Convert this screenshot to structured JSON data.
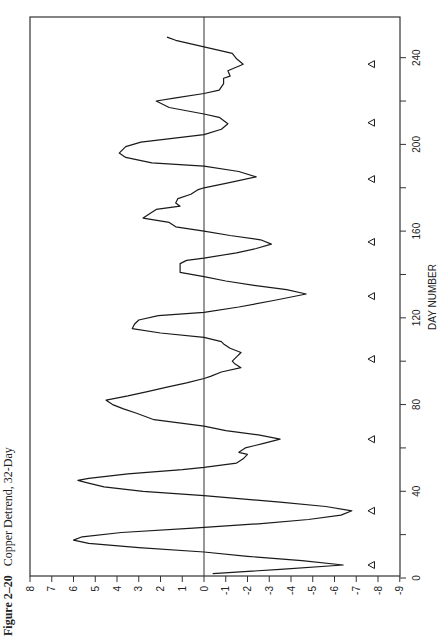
{
  "figure": {
    "number": "Figure 2–20",
    "caption": "Copper Detrend, 32-Day"
  },
  "colors": {
    "line": "#1a1a1a",
    "axis": "#333333",
    "background": "#ffffff"
  },
  "chart_data": {
    "type": "line",
    "title": "Figure 2–20 Copper Detrend, 32-Day",
    "orientation": "rotated-90-ccw",
    "xlabel": "DAY NUMBER",
    "ylabel": "",
    "xlim": [
      0,
      258
    ],
    "ylim": [
      -9,
      8
    ],
    "xticks": [
      0,
      40,
      80,
      120,
      160,
      200,
      240
    ],
    "xminor_ticks": [
      20,
      60,
      100,
      140,
      180,
      220
    ],
    "yticks": [
      8,
      7,
      6,
      5,
      4,
      3,
      2,
      1,
      0,
      -1,
      -2,
      -3,
      -4,
      -5,
      -6,
      -7,
      -8,
      -9
    ],
    "zero_line": true,
    "grid": false,
    "series": [
      {
        "name": "Copper Detrend 32-Day",
        "points": [
          [
            2,
            -0.4
          ],
          [
            4,
            -3.5
          ],
          [
            6,
            -6.4
          ],
          [
            8,
            -4.5
          ],
          [
            10,
            -2.0
          ],
          [
            12,
            0.0
          ],
          [
            14,
            3.0
          ],
          [
            16,
            5.3
          ],
          [
            17.5,
            6.0
          ],
          [
            19,
            5.6
          ],
          [
            21,
            3.8
          ],
          [
            23,
            0.5
          ],
          [
            25,
            -2.5
          ],
          [
            27,
            -4.8
          ],
          [
            29,
            -6.3
          ],
          [
            31,
            -6.8
          ],
          [
            33,
            -5.6
          ],
          [
            35,
            -3.5
          ],
          [
            38,
            0.0
          ],
          [
            40,
            2.8
          ],
          [
            42,
            4.6
          ],
          [
            44,
            5.4
          ],
          [
            45,
            5.8
          ],
          [
            46,
            5.3
          ],
          [
            48,
            3.5
          ],
          [
            50,
            1.0
          ],
          [
            51,
            0.0
          ],
          [
            53,
            -1.5
          ],
          [
            55,
            -1.8
          ],
          [
            57,
            -2.0
          ],
          [
            58,
            -1.6
          ],
          [
            60,
            -1.9
          ],
          [
            62,
            -2.7
          ],
          [
            64,
            -3.5
          ],
          [
            66,
            -2.5
          ],
          [
            68,
            -1.0
          ],
          [
            70,
            0.0
          ],
          [
            73,
            2.3
          ],
          [
            76,
            3.1
          ],
          [
            78,
            3.7
          ],
          [
            80,
            4.2
          ],
          [
            82,
            4.5
          ],
          [
            84,
            3.5
          ],
          [
            86,
            2.6
          ],
          [
            88,
            1.7
          ],
          [
            90,
            0.8
          ],
          [
            92,
            0.0
          ],
          [
            93,
            -0.3
          ],
          [
            95,
            -0.8
          ],
          [
            97,
            -1.7
          ],
          [
            99,
            -1.4
          ],
          [
            100,
            -1.3
          ],
          [
            102,
            -1.5
          ],
          [
            104,
            -1.7
          ],
          [
            106,
            -1.2
          ],
          [
            108,
            -0.9
          ],
          [
            109,
            -0.8
          ],
          [
            111,
            0.0
          ],
          [
            113,
            2.0
          ],
          [
            115,
            3.3
          ],
          [
            117,
            3.2
          ],
          [
            119,
            3.0
          ],
          [
            121,
            2.1
          ],
          [
            122.5,
            0.0
          ],
          [
            125,
            -1.6
          ],
          [
            128,
            -3.2
          ],
          [
            131,
            -4.7
          ],
          [
            133,
            -3.8
          ],
          [
            135,
            -2.3
          ],
          [
            137,
            -1.0
          ],
          [
            139,
            0.0
          ],
          [
            141,
            1.1
          ],
          [
            143,
            1.1
          ],
          [
            145,
            1.1
          ],
          [
            146.5,
            0.8
          ],
          [
            147.5,
            0.0
          ],
          [
            150,
            -1.5
          ],
          [
            152,
            -2.4
          ],
          [
            154,
            -3.1
          ],
          [
            156,
            -2.6
          ],
          [
            158,
            -1.2
          ],
          [
            160,
            0.0
          ],
          [
            162,
            1.3
          ],
          [
            164,
            1.6
          ],
          [
            166,
            2.8
          ],
          [
            168,
            2.5
          ],
          [
            170,
            2.2
          ],
          [
            171.5,
            1.1
          ],
          [
            173,
            1.3
          ],
          [
            175,
            1.2
          ],
          [
            177,
            0.6
          ],
          [
            179,
            0.3
          ],
          [
            180,
            0.0
          ],
          [
            182,
            -1.0
          ],
          [
            185,
            -2.4
          ],
          [
            187.5,
            -1.6
          ],
          [
            190,
            0.0
          ],
          [
            191.5,
            2.4
          ],
          [
            194,
            3.6
          ],
          [
            196,
            3.9
          ],
          [
            199,
            3.6
          ],
          [
            201,
            2.9
          ],
          [
            204.5,
            0.0
          ],
          [
            207,
            -0.8
          ],
          [
            209.5,
            -1.1
          ],
          [
            212.5,
            -0.7
          ],
          [
            214,
            0.0
          ],
          [
            217,
            1.6
          ],
          [
            220,
            2.2
          ],
          [
            221.5,
            1.3
          ],
          [
            223.5,
            0.0
          ],
          [
            225,
            -0.7
          ],
          [
            228,
            -0.9
          ],
          [
            230.5,
            -0.9
          ],
          [
            231.5,
            -1.2
          ],
          [
            234,
            -1.1
          ],
          [
            237,
            -1.8
          ],
          [
            239.5,
            -1.5
          ],
          [
            242,
            -1.3
          ],
          [
            245,
            0.0
          ],
          [
            248,
            1.3
          ],
          [
            249.5,
            1.7
          ]
        ]
      }
    ],
    "annotations": {
      "marker": "left-pointing triangle",
      "description": "cycle low markers",
      "value": -7.7,
      "days": [
        6,
        31,
        64,
        101,
        130,
        155,
        184,
        210,
        237
      ]
    }
  }
}
